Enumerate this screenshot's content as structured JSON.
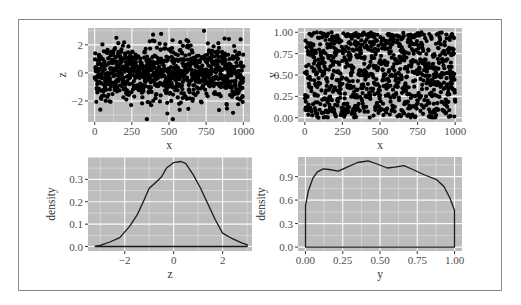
{
  "chart_data": [
    {
      "type": "scatter",
      "panel": "top-left",
      "title": "",
      "xlabel": "x",
      "ylabel": "z",
      "xlim": [
        -45,
        1045
      ],
      "ylim": [
        -3.5,
        3.2
      ],
      "xticks": [
        0,
        250,
        500,
        750,
        1000
      ],
      "xtick_labels": [
        "0",
        "250",
        "500",
        "750",
        "1000"
      ],
      "yticks": [
        -2,
        0,
        2
      ],
      "ytick_labels": [
        "-2",
        "0",
        "2"
      ],
      "n_points": 1000,
      "description": "1000 points, x = index 1..1000, z ~ standard normal",
      "grid": true,
      "background": "#bdbdbd",
      "point_color": "#000000"
    },
    {
      "type": "scatter",
      "panel": "top-right",
      "title": "",
      "xlabel": "x",
      "ylabel": "y",
      "xlim": [
        -45,
        1045
      ],
      "ylim": [
        -0.05,
        1.05
      ],
      "xticks": [
        0,
        250,
        500,
        750,
        1000
      ],
      "xtick_labels": [
        "0",
        "250",
        "500",
        "750",
        "1000"
      ],
      "yticks": [
        0,
        0.25,
        0.5,
        0.75,
        1.0
      ],
      "ytick_labels": [
        "0.00",
        "0.25",
        "0.50",
        "0.75",
        "1.00"
      ],
      "n_points": 1000,
      "description": "1000 points, x = index 1..1000, y ~ uniform(0,1)",
      "grid": true,
      "background": "#bdbdbd",
      "point_color": "#000000"
    },
    {
      "type": "line",
      "panel": "bottom-left",
      "title": "",
      "xlabel": "z",
      "ylabel": "density",
      "xlim": [
        -3.5,
        3.2
      ],
      "ylim": [
        -0.02,
        0.4
      ],
      "xticks": [
        -2,
        0,
        2
      ],
      "xtick_labels": [
        "-2",
        "0",
        "2"
      ],
      "yticks": [
        0,
        0.1,
        0.2,
        0.3
      ],
      "ytick_labels": [
        "0.0",
        "0.1",
        "0.2",
        "0.3"
      ],
      "x": [
        -3.2,
        -3.0,
        -2.6,
        -2.2,
        -1.8,
        -1.5,
        -1.2,
        -1.0,
        -0.8,
        -0.5,
        -0.3,
        0.0,
        0.3,
        0.5,
        0.8,
        1.1,
        1.4,
        1.7,
        2.0,
        2.4,
        2.8,
        3.0
      ],
      "series": [
        {
          "name": "density",
          "values": [
            0.002,
            0.005,
            0.02,
            0.04,
            0.09,
            0.14,
            0.21,
            0.26,
            0.28,
            0.31,
            0.35,
            0.375,
            0.38,
            0.37,
            0.32,
            0.26,
            0.19,
            0.12,
            0.06,
            0.035,
            0.015,
            0.008
          ]
        }
      ],
      "grid": true,
      "background": "#bdbdbd"
    },
    {
      "type": "line",
      "panel": "bottom-right",
      "title": "",
      "xlabel": "y",
      "ylabel": "density",
      "xlim": [
        -0.05,
        1.05
      ],
      "ylim": [
        -0.05,
        1.15
      ],
      "xticks": [
        0,
        0.25,
        0.5,
        0.75,
        1.0
      ],
      "xtick_labels": [
        "0.00",
        "0.25",
        "0.50",
        "0.75",
        "1.00"
      ],
      "yticks": [
        0,
        0.3,
        0.6,
        0.9
      ],
      "ytick_labels": [
        "0.0",
        "0.3",
        "0.6",
        "0.9"
      ],
      "x": [
        0.0,
        0.02,
        0.05,
        0.08,
        0.12,
        0.16,
        0.22,
        0.28,
        0.35,
        0.42,
        0.48,
        0.55,
        0.6,
        0.66,
        0.72,
        0.8,
        0.88,
        0.93,
        0.97,
        1.0
      ],
      "series": [
        {
          "name": "density",
          "values": [
            0.53,
            0.72,
            0.88,
            0.96,
            1.0,
            0.99,
            0.97,
            1.02,
            1.08,
            1.1,
            1.06,
            1.01,
            1.02,
            1.04,
            0.99,
            0.92,
            0.86,
            0.77,
            0.62,
            0.47
          ]
        }
      ],
      "grid": true,
      "background": "#bdbdbd"
    }
  ]
}
